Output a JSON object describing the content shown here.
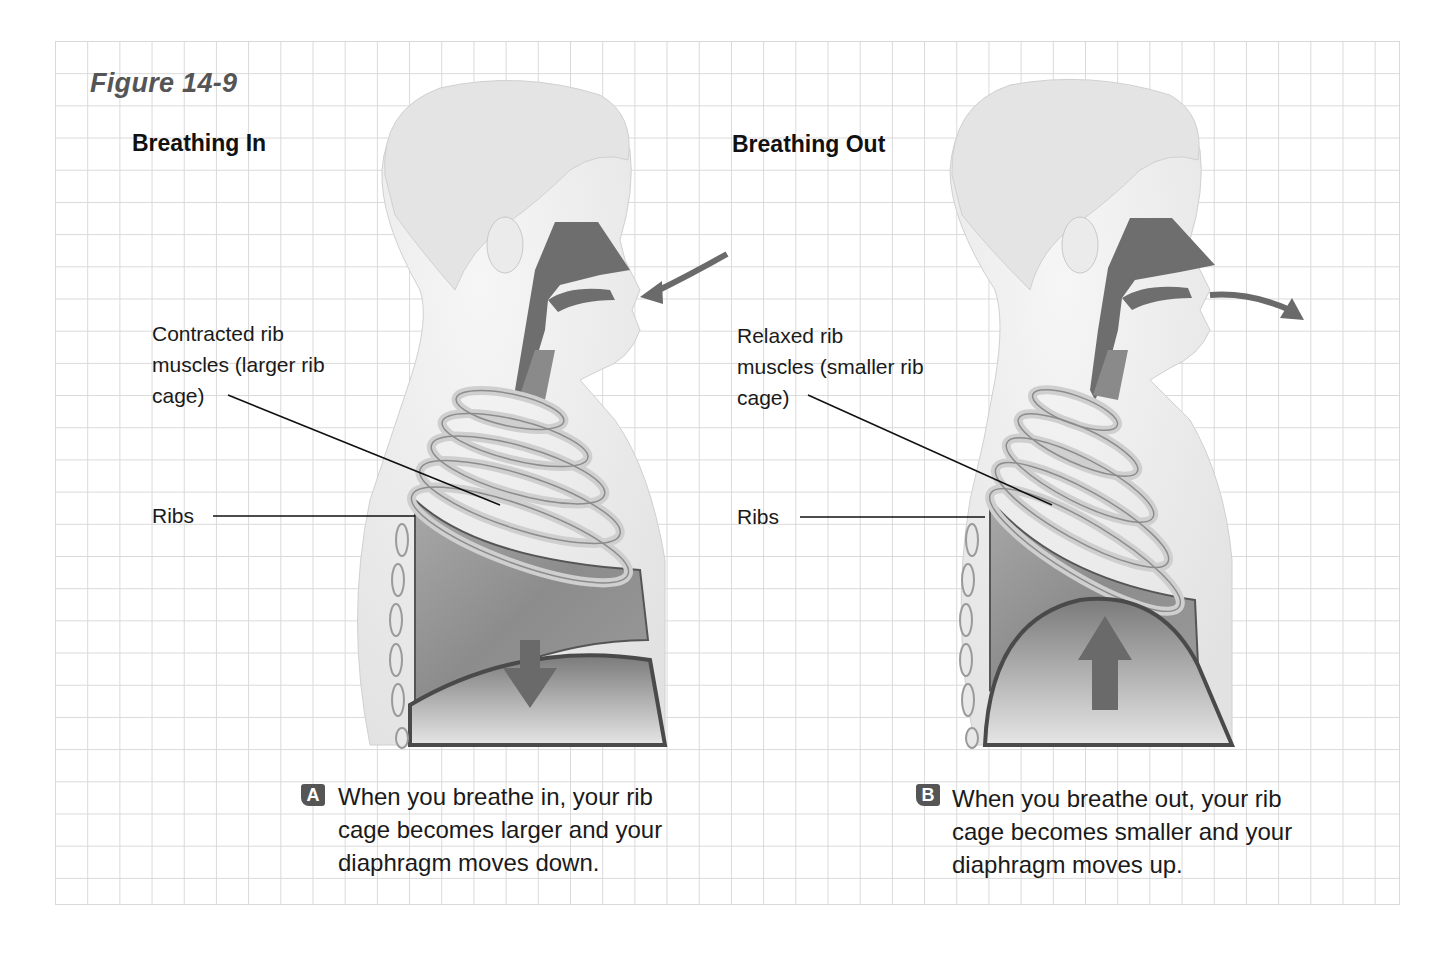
{
  "figure": {
    "title": "Figure 14-9"
  },
  "panels": [
    {
      "id": "A",
      "title": "Breathing In",
      "badge": "A",
      "labels": {
        "muscles": "Contracted rib\nmuscles (larger rib\ncage)",
        "ribs": "Ribs"
      },
      "caption": "When you breathe in, your rib\ncage becomes larger and your\ndiaphragm moves down.",
      "air_arrow": "inward",
      "diaphragm_arrow": "down"
    },
    {
      "id": "B",
      "title": "Breathing Out",
      "badge": "B",
      "labels": {
        "muscles": "Relaxed rib\nmuscles (smaller rib\ncage)",
        "ribs": "Ribs"
      },
      "caption": "When you breathe out, your rib\ncage becomes smaller and your\ndiaphragm moves up.",
      "air_arrow": "outward",
      "diaphragm_arrow": "up"
    }
  ],
  "colors": {
    "grid": "#d9d9d9",
    "airway": "#6e6e6e",
    "arrow": "#6a6a6a",
    "skin": "#ececec",
    "badge": "#555555"
  }
}
